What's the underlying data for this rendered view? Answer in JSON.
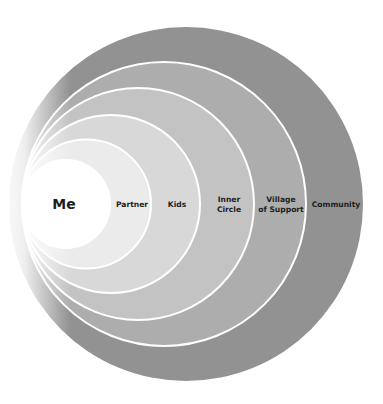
{
  "diagram": {
    "type": "concentric-circles",
    "title": "",
    "layers": [
      {
        "id": "community",
        "label_lines": [
          "Community"
        ],
        "fill": "#929292",
        "cx": 186,
        "r": 177,
        "label_x": 336
      },
      {
        "id": "village",
        "label_lines": [
          "Village",
          "of Support"
        ],
        "fill": "#adadad",
        "cx": 164,
        "r": 142,
        "label_x": 281
      },
      {
        "id": "inner-circle",
        "label_lines": [
          "Inner",
          "Circle"
        ],
        "fill": "#c3c3c3",
        "cx": 138,
        "r": 116,
        "label_x": 229
      },
      {
        "id": "kids",
        "label_lines": [
          "Kids"
        ],
        "fill": "#d8d8d8",
        "cx": 111,
        "r": 89,
        "label_x": 177
      },
      {
        "id": "partner",
        "label_lines": [
          "Partner"
        ],
        "fill": "#ebebeb",
        "cx": 86.5,
        "r": 64.5,
        "label_x": 132
      },
      {
        "id": "me",
        "label_lines": [
          "Me"
        ],
        "fill": "#ffffff",
        "cx": 66,
        "r": 44,
        "label_x": 64
      }
    ],
    "center_y": 204,
    "stroke_color": "#ffffff",
    "text_color": "#1e1e1e"
  }
}
